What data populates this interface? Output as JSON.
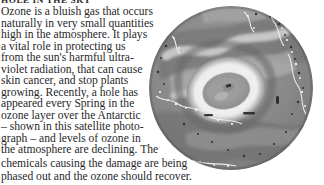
{
  "article": {
    "headline": "HOLE IN THE SKY",
    "body_lines": [
      "Ozone is a bluish gas that occurs",
      "naturally in very small quantities",
      "high in the atmosphere. It plays",
      "a vital role in protecting us",
      "from the sun's harmful ultra-",
      "violet radiation, that can cause",
      "skin cancer, and stop plants",
      "growing. Recently, a hole has",
      "appeared every Spring in the",
      "ozone layer over the Antarctic",
      "– shown in this satellite photo-",
      "graph – and levels of ozone in",
      "the atmosphere are declining. The",
      "chemicals causing the damage are being",
      "phased out and the ozone should recover."
    ],
    "body_text": "Ozone is a bluish gas that occurs naturally in very small quantities high in the atmosphere. It plays a vital role in protecting us from the sun's harmful ultra-violet radiation, that can cause skin cancer, and stop plants growing. Recently, a hole has appeared every Spring in the ozone layer over the Antarctic – shown in this satellite photograph – and levels of ozone in the atmosphere are declining. The chemicals causing the damage are being phased out and the ozone should recover."
  },
  "figure": {
    "name": "antarctic-ozone-hole-satellite-photograph",
    "caption_in_text": "shown in this satellite photograph",
    "shape": "circle",
    "rendering": "grayscale satellite map of the Antarctic polar region showing the ozone hole as a bright ring around a darker core",
    "colors": {
      "disc_mid_gray": "#8c8c8c",
      "disc_dark_gray": "#5d5d5d",
      "hole_bright": "#ededed",
      "hole_core": "#9a9a9a",
      "speckle_black": "#232323",
      "page_background": "#ffffff",
      "text_color": "#28282a",
      "headline_color": "#2b2b2b"
    }
  }
}
